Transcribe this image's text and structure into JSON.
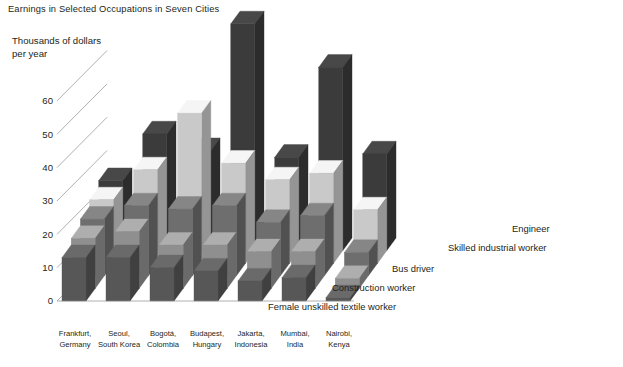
{
  "chart_data": {
    "type": "bar",
    "variant": "3d-grouped-depth",
    "title": "Earnings in Selected Occupations in Seven Cities",
    "ylabel": "Thousands of dollars per year",
    "xlabel": "",
    "ylim": [
      0,
      70
    ],
    "yticks": [
      0,
      10,
      20,
      30,
      40,
      50,
      60
    ],
    "grid": true,
    "legend_position": "right",
    "categories": [
      "Frankfurt, Germany",
      "Seoul, South Korea",
      "Bogotá, Colombia",
      "Budapest, Hungary",
      "Jakarta, Indonesia",
      "Mumbai, India",
      "Nairobi, Kenya"
    ],
    "categories_lines": [
      [
        "Frankfurt,",
        "Germany"
      ],
      [
        "Seoul,",
        "South Korea"
      ],
      [
        "Bogotá,",
        "Colombia"
      ],
      [
        "Budapest,",
        "Hungary"
      ],
      [
        "Jakarta,",
        "Indonesia"
      ],
      [
        "Mumbai,",
        "India"
      ],
      [
        "Nairobi,",
        "Kenya"
      ]
    ],
    "series": [
      {
        "name": "Engineer",
        "color": "#3b3b3b",
        "values": [
          21,
          35,
          30,
          68,
          28,
          55,
          29
        ]
      },
      {
        "name": "Skilled industrial worker",
        "color": "#c9c9c9",
        "values": [
          19,
          28,
          45,
          30,
          25,
          27,
          16
        ]
      },
      {
        "name": "Bus driver",
        "color": "#6e6e6e",
        "values": [
          17,
          21,
          20,
          21,
          16,
          18,
          7
        ]
      },
      {
        "name": "Construction worker",
        "color": "#8f8f8f",
        "values": [
          15,
          17,
          13,
          13,
          11,
          11,
          3
        ]
      },
      {
        "name": "Female unskilled textile worker",
        "color": "#575757",
        "values": [
          13,
          13,
          10,
          9,
          6,
          7,
          1
        ]
      }
    ]
  },
  "legend": {
    "items": [
      {
        "label": "Engineer"
      },
      {
        "label": "Skilled industrial worker"
      },
      {
        "label": "Bus driver"
      },
      {
        "label": "Construction worker"
      },
      {
        "label": "Female unskilled textile worker"
      }
    ]
  }
}
